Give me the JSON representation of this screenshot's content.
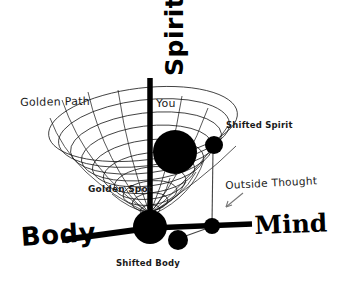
{
  "diagram": {
    "background_color": "#ffffff",
    "ink_color": "#000000",
    "axes": [
      {
        "id": "spirit",
        "label": "Spirit",
        "orientation": "vertical-up",
        "rotation_deg": -90
      },
      {
        "id": "body",
        "label": "Body",
        "orientation": "down-left"
      },
      {
        "id": "mind",
        "label": "Mind",
        "orientation": "right"
      }
    ],
    "annotations": [
      {
        "id": "golden-path",
        "label": "Golden Path",
        "style": "plain"
      },
      {
        "id": "you",
        "label": "You",
        "style": "plain"
      },
      {
        "id": "shifted-spirit",
        "label": "Shifted Spirit",
        "style": "bold-small"
      },
      {
        "id": "outside-thought",
        "label": "Outside Thought",
        "style": "plain"
      },
      {
        "id": "golden-spot",
        "label": "Golden Spot",
        "style": "bold-small"
      },
      {
        "id": "shifted-body",
        "label": "Shifted Body",
        "style": "bold-small"
      }
    ],
    "nodes": [
      {
        "id": "you-sphere",
        "label": "You",
        "cx": 175,
        "cy": 152,
        "r": 22
      },
      {
        "id": "golden-spot-sphere",
        "label": "Golden Spot",
        "cx": 150,
        "cy": 227,
        "r": 17
      },
      {
        "id": "shifted-spirit-sphere",
        "label": "Shifted Spirit",
        "cx": 214,
        "cy": 145,
        "r": 9
      },
      {
        "id": "shifted-body-sphere",
        "label": "Shifted Body",
        "cx": 178,
        "cy": 240,
        "r": 10
      },
      {
        "id": "mind-axis-node",
        "label": "Outside Thought",
        "cx": 212,
        "cy": 226,
        "r": 8
      }
    ],
    "connectors": [
      {
        "id": "spirit-shift-connector",
        "from": "shifted-spirit-sphere",
        "to": "mind-axis-node"
      },
      {
        "id": "body-shift-connector",
        "from": "shifted-body-sphere",
        "to": "mind-axis-node"
      },
      {
        "id": "outside-thought-pointer",
        "from": "outside-thought-label",
        "to": "mind-axis-node"
      }
    ],
    "vortex": {
      "id": "golden-path-vortex",
      "description": "conical spiral funnel of thin ellipses narrowing toward the Golden Spot",
      "ring_count": 9
    }
  }
}
